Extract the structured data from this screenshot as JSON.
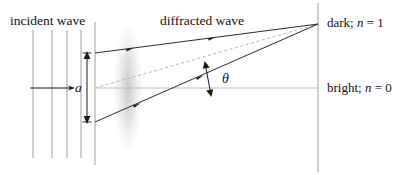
{
  "figure": {
    "kind": "physics-diagram",
    "topic": "single-slit-diffraction",
    "width": 407,
    "height": 175,
    "background": "#ffffff"
  },
  "labels": {
    "incident_wave": "incident wave",
    "diffracted_wave": "diffracted wave",
    "dark_fringe": "dark; ",
    "dark_fringe_var": "n",
    "dark_fringe_eq": " = 1",
    "bright_fringe": "bright; ",
    "bright_fringe_var": "n",
    "bright_fringe_eq": " = 0",
    "slit_width": "a",
    "angle": "θ"
  },
  "colors": {
    "ink": "#111111",
    "wavefront": "#9a9a9a",
    "axis": "#b4b4b4",
    "dashed": "#c9aeae",
    "ray": "#2b2b2b",
    "screen": "#9a9a9a",
    "beam_glow": "#d9d9d9"
  },
  "geometry": {
    "slit_plane_x": 95,
    "screen_x": 318,
    "axis_y": 88,
    "slit_top_y": 53,
    "slit_bottom_y": 122,
    "converge_x": 318,
    "converge_y": 24,
    "wavefront_xs": [
      33,
      52,
      67,
      81
    ],
    "wavefront_top_y": 30,
    "wavefront_bottom_y": 158,
    "incident_arrow_y": 88,
    "incident_arrow_x1": 30,
    "incident_arrow_x2": 74
  },
  "elements": {
    "wavefront_count": 4,
    "ray_count": 2,
    "dimension_arrow": "double-headed-vertical",
    "angle_arrow": "double-headed",
    "center_line": "solid-gray-horizontal",
    "dashed_line": "dashed-rose-diagonal"
  }
}
